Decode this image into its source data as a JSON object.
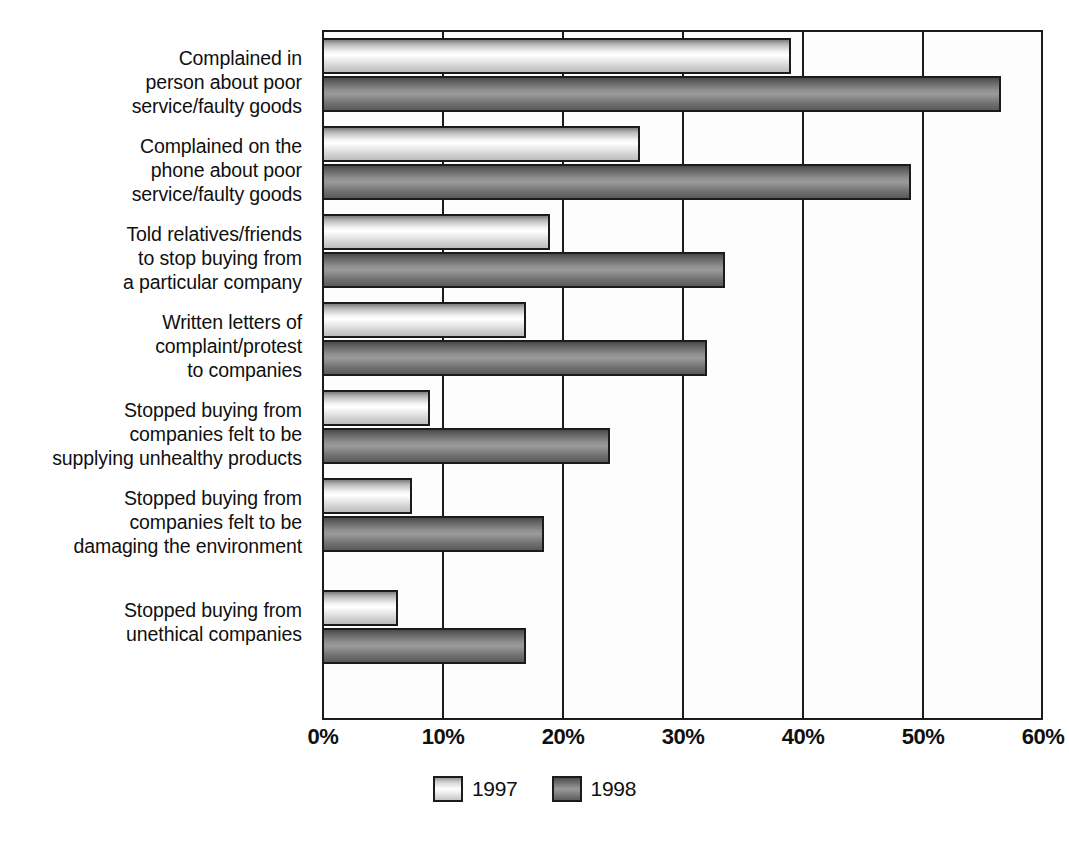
{
  "chart_data": {
    "type": "bar",
    "orientation": "horizontal",
    "title": "",
    "subtitle": "",
    "xlabel": "",
    "ylabel": "",
    "xlim": [
      0,
      60
    ],
    "xticks": [
      "0%",
      "10%",
      "20%",
      "30%",
      "40%",
      "50%",
      "60%"
    ],
    "xtick_values": [
      0,
      10,
      20,
      30,
      40,
      50,
      60
    ],
    "grid": true,
    "grid_axis": "x",
    "legend_position": "bottom-center",
    "categories": [
      "Complained in person about poor service/faulty goods",
      "Complained on the phone about poor service/faulty goods",
      "Told relatives/friends to stop buying from a particular company",
      "Written letters of complaint/protest to companies",
      "Stopped buying from companies felt to be supplying unhealthy products",
      "Stopped buying from companies felt to be damaging the environment",
      "Stopped buying from unethical companies"
    ],
    "category_lines": [
      [
        "Complained in",
        "person about poor",
        "service/faulty goods"
      ],
      [
        "Complained on the",
        "phone about poor",
        "service/faulty goods"
      ],
      [
        "Told relatives/friends",
        "to stop buying from",
        "a particular company"
      ],
      [
        "Written letters of",
        "complaint/protest",
        "to companies"
      ],
      [
        "Stopped buying from",
        "companies felt to be",
        "supplying unhealthy products"
      ],
      [
        "Stopped buying from",
        "companies felt to be",
        "damaging the environment"
      ],
      [
        "Stopped buying from",
        "unethical companies"
      ]
    ],
    "series": [
      {
        "name": "1997",
        "color": "#e8e8e8",
        "values": [
          39.0,
          26.5,
          19.0,
          17.0,
          9.0,
          7.5,
          6.3
        ]
      },
      {
        "name": "1998",
        "color": "#7d7d7d",
        "values": [
          56.5,
          49.0,
          33.5,
          32.0,
          24.0,
          18.5,
          17.0
        ]
      }
    ]
  },
  "legend": {
    "items": [
      {
        "label": "1997"
      },
      {
        "label": "1998"
      }
    ]
  }
}
